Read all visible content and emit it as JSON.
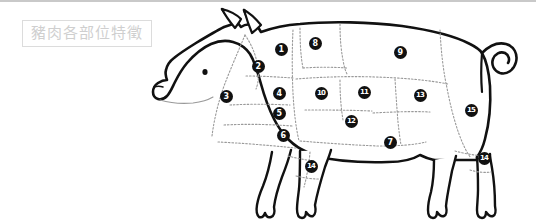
{
  "page": {
    "background_color": "#ffffff",
    "width": 536,
    "height": 223
  },
  "top_rule": {
    "color": "#c9c9c9"
  },
  "title": {
    "text": "豬肉各部位特徵",
    "text_color": "#cfcfcf",
    "border_color": "#dcdcdc"
  },
  "diagram": {
    "outline_color": "#111111",
    "divider_color": "#9a9a9a",
    "divider_style": "dotted",
    "marker_fill": "#111111",
    "marker_text_color": "#ffffff",
    "markers": [
      {
        "label": "1",
        "x": 281,
        "y": 49
      },
      {
        "label": "2",
        "x": 258,
        "y": 66
      },
      {
        "label": "3",
        "x": 226,
        "y": 96
      },
      {
        "label": "4",
        "x": 279,
        "y": 93
      },
      {
        "label": "5",
        "x": 279,
        "y": 113
      },
      {
        "label": "6",
        "x": 283,
        "y": 135
      },
      {
        "label": "7",
        "x": 390,
        "y": 142
      },
      {
        "label": "8",
        "x": 315,
        "y": 43
      },
      {
        "label": "9",
        "x": 400,
        "y": 52
      },
      {
        "label": "10",
        "x": 321,
        "y": 93
      },
      {
        "label": "11",
        "x": 364,
        "y": 92
      },
      {
        "label": "12",
        "x": 351,
        "y": 121
      },
      {
        "label": "13",
        "x": 420,
        "y": 95
      },
      {
        "label": "14",
        "x": 311,
        "y": 166
      },
      {
        "label": "15",
        "x": 471,
        "y": 110
      },
      {
        "label": "14",
        "x": 484,
        "y": 158
      }
    ]
  }
}
